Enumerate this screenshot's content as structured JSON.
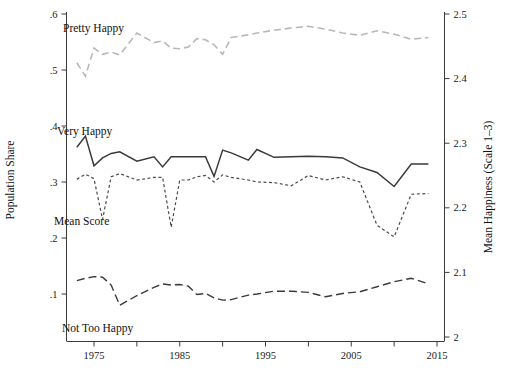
{
  "chart_data": {
    "type": "line",
    "title": "",
    "xlabel": "",
    "ylabel": "Population Share",
    "y2label": "Mean Happiness (Scale 1–3)",
    "grid": false,
    "legend_position": "inline-annotations",
    "xlim": [
      1972,
      2016
    ],
    "ylim": [
      0.05,
      0.62
    ],
    "y2lim": [
      1.99,
      2.51
    ],
    "xticks": [
      1975,
      1980,
      1985,
      1990,
      1995,
      2000,
      2005,
      2010,
      2015
    ],
    "xtick_labels": [
      "1975",
      "",
      "1985",
      "",
      "1995",
      "",
      "2005",
      "",
      "2015"
    ],
    "yticks": [
      0.1,
      0.2,
      0.3,
      0.4,
      0.5,
      0.6
    ],
    "ytick_labels": [
      ".1",
      ".2",
      ".3",
      ".4",
      ".5",
      ".6"
    ],
    "y2ticks": [
      2.0,
      2.1,
      2.2,
      2.3,
      2.4,
      2.5
    ],
    "y2tick_labels": [
      "2",
      "2.1",
      "2.2",
      "2.3",
      "2.4",
      "2.5"
    ],
    "series": [
      {
        "name": "Pretty Happy",
        "label": "Pretty Happy",
        "axis": "left",
        "style": "dashed",
        "color": "#b8b8b8",
        "width": 1.6,
        "dash": "7,4",
        "x": [
          1973,
          1974,
          1975,
          1976,
          1977,
          1978,
          1980,
          1982,
          1983,
          1984,
          1985,
          1986,
          1987,
          1988,
          1989,
          1990,
          1991,
          1993,
          1994,
          1996,
          1998,
          2000,
          2002,
          2004,
          2006,
          2008,
          2010,
          2012,
          2014
        ],
        "values": [
          0.513,
          0.489,
          0.539,
          0.528,
          0.532,
          0.527,
          0.566,
          0.549,
          0.552,
          0.539,
          0.538,
          0.541,
          0.556,
          0.554,
          0.545,
          0.528,
          0.558,
          0.563,
          0.566,
          0.571,
          0.575,
          0.578,
          0.573,
          0.566,
          0.562,
          0.57,
          0.564,
          0.555,
          0.558
        ]
      },
      {
        "name": "Very Happy",
        "label": "Very Happy",
        "axis": "left",
        "style": "solid",
        "color": "#3a3a3a",
        "width": 1.5,
        "dash": "none",
        "x": [
          1973,
          1974,
          1975,
          1976,
          1977,
          1978,
          1980,
          1982,
          1983,
          1984,
          1985,
          1986,
          1987,
          1988,
          1989,
          1990,
          1991,
          1993,
          1994,
          1996,
          1998,
          2000,
          2002,
          2004,
          2006,
          2008,
          2010,
          2012,
          2014
        ],
        "values": [
          0.362,
          0.382,
          0.329,
          0.343,
          0.351,
          0.354,
          0.337,
          0.345,
          0.327,
          0.345,
          0.345,
          0.345,
          0.345,
          0.345,
          0.31,
          0.357,
          0.352,
          0.339,
          0.358,
          0.344,
          0.345,
          0.346,
          0.345,
          0.343,
          0.327,
          0.317,
          0.292,
          0.332,
          0.332
        ]
      },
      {
        "name": "Mean Score",
        "label": "Mean Score",
        "axis": "right",
        "style": "dotted",
        "color": "#4a4a4a",
        "width": 1.2,
        "dash": "3,2.5",
        "x": [
          1973,
          1974,
          1975,
          1976,
          1977,
          1978,
          1980,
          1982,
          1983,
          1984,
          1985,
          1986,
          1987,
          1988,
          1989,
          1990,
          1991,
          1993,
          1994,
          1996,
          1998,
          2000,
          2002,
          2004,
          2006,
          2008,
          2010,
          2012,
          2014
        ],
        "values": [
          2.244,
          2.252,
          2.245,
          2.182,
          2.248,
          2.253,
          2.243,
          2.247,
          2.247,
          2.17,
          2.243,
          2.243,
          2.248,
          2.25,
          2.24,
          2.251,
          2.247,
          2.243,
          2.24,
          2.239,
          2.234,
          2.25,
          2.243,
          2.248,
          2.24,
          2.173,
          2.155,
          2.221,
          2.222
        ]
      },
      {
        "name": "Not Too Happy",
        "label": "Not Too Happy",
        "axis": "left",
        "style": "long-dashed",
        "color": "#3a3a3a",
        "width": 1.4,
        "dash": "8,4",
        "x": [
          1973,
          1974,
          1975,
          1976,
          1977,
          1978,
          1980,
          1982,
          1983,
          1984,
          1985,
          1986,
          1987,
          1988,
          1989,
          1990,
          1991,
          1993,
          1994,
          1996,
          1998,
          2000,
          2002,
          2004,
          2006,
          2008,
          2010,
          2012,
          2014
        ],
        "values": [
          0.124,
          0.128,
          0.131,
          0.13,
          0.116,
          0.08,
          0.097,
          0.112,
          0.118,
          0.116,
          0.117,
          0.114,
          0.099,
          0.101,
          0.093,
          0.089,
          0.09,
          0.098,
          0.1,
          0.105,
          0.105,
          0.103,
          0.095,
          0.101,
          0.104,
          0.113,
          0.122,
          0.128,
          0.118
        ]
      }
    ],
    "annotations": [
      {
        "text": "Pretty Happy",
        "x_px": 63,
        "y_px": 32
      },
      {
        "text": "Very Happy",
        "x_px": 57,
        "y_px": 135
      },
      {
        "text": "Mean Score",
        "x_px": 54,
        "y_px": 225
      },
      {
        "text": "Not Too Happy",
        "x_px": 62,
        "y_px": 332
      }
    ]
  }
}
